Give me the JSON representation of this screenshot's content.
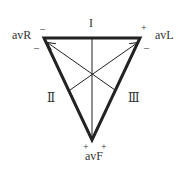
{
  "diagram": {
    "leads": {
      "I": "I",
      "II": "Ⅱ",
      "III": "Ⅲ"
    },
    "augmented": {
      "avR": "avR",
      "avL": "avL",
      "avF": "avF"
    },
    "signs": {
      "topleft_top": "–",
      "topleft_side": "–",
      "topright_top": "+",
      "topright_side": "–",
      "bottom_left": "+",
      "bottom_right": "+"
    },
    "colors": {
      "stroke": "#222222",
      "text": "#333333"
    }
  }
}
